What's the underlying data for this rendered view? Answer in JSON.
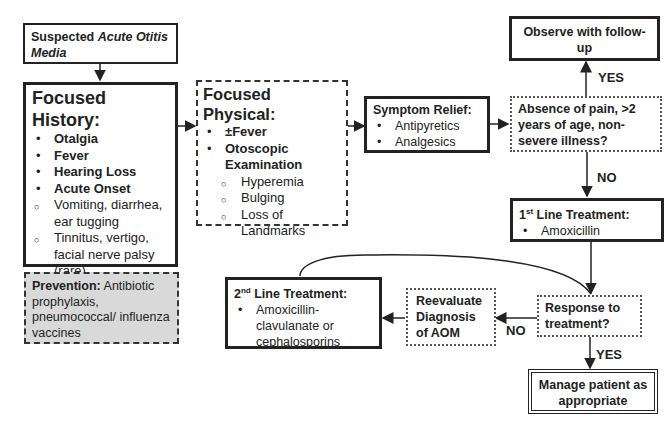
{
  "boxes": {
    "suspected": {
      "prefix": "Suspected ",
      "italic": "Acute Otitis Media"
    },
    "history": {
      "title": "Focused History:",
      "bold_items": [
        "Otalgia",
        "Fever",
        "Hearing Loss",
        "Acute Onset"
      ],
      "minor_items": [
        "Vomiting, diarrhea, ear tugging",
        "Tinnitus, vertigo, facial nerve palsy (rare)"
      ]
    },
    "prevention": {
      "title": "Prevention:",
      "text": " Antibiotic prophylaxis, pneumococcal/ influenza vaccines"
    },
    "physical": {
      "title": "Focused Physical:",
      "items": [
        "±Fever",
        "Otoscopic Examination"
      ],
      "sub_items": [
        "Hyperemia",
        "Bulging",
        "Loss of Landmarks"
      ]
    },
    "symptom": {
      "title": "Symptom Relief:",
      "items": [
        "Antipyretics",
        "Analgesics"
      ]
    },
    "absence": {
      "text": "Absence of pain, >2 years of age, non-severe illness?"
    },
    "observe": {
      "text": "Observe with follow-up"
    },
    "first_line": {
      "num": "1",
      "sup": "st",
      "title": " Line Treatment:",
      "items": [
        "Amoxicillin"
      ]
    },
    "response": {
      "text": "Response to treatment?"
    },
    "manage": {
      "text": "Manage patient as appropriate"
    },
    "reevaluate": {
      "text": "Reevaluate Diagnosis of AOM"
    },
    "second_line": {
      "num": "2",
      "sup": "nd",
      "title": " Line Treatment:",
      "items": [
        "Amoxicillin-clavulanate or cephalosporins"
      ]
    }
  },
  "labels": {
    "yes_top": "YES",
    "no_mid": "NO",
    "no_left": "NO",
    "yes_bottom": "YES"
  }
}
